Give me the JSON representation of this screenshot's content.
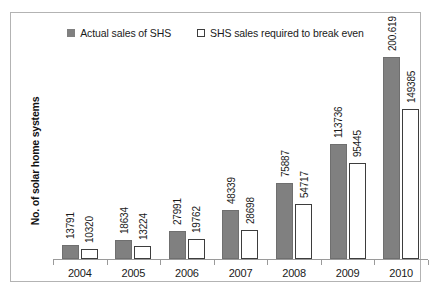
{
  "chart_data": {
    "type": "bar",
    "title": "",
    "subtitle": "",
    "xlabel": "",
    "ylabel": "No. of solar home systems",
    "categories": [
      "2004",
      "2005",
      "2006",
      "2007",
      "2008",
      "2009",
      "2010"
    ],
    "series": [
      {
        "name": "Actual sales of SHS",
        "swatch": "filled-gray-square",
        "color": "#808080",
        "values": [
          13791,
          18634,
          27991,
          48339,
          75887,
          113736,
          200619
        ],
        "labels": [
          "13791",
          "18634",
          "27991",
          "48339",
          "75887",
          "113736",
          "200.619"
        ]
      },
      {
        "name": "SHS sales required to break even",
        "swatch": "hollow-white-square",
        "color": "#ffffff",
        "border_color": "#3d3d3d",
        "values": [
          10320,
          13224,
          19762,
          28698,
          54717,
          95445,
          149385
        ],
        "labels": [
          "10320",
          "13224",
          "19762",
          "28698",
          "54717",
          "95445",
          "149385"
        ]
      }
    ],
    "ylim": [
      0,
      200619
    ],
    "y_tick_labels": [],
    "grid": false,
    "legend_position": "top-center",
    "data_labels_rotation": "vertical",
    "plot_border_color": "#b3b3b3",
    "axis_line_color": "#9a9a9a"
  },
  "legend": {
    "entries": [
      {
        "label": "Actual sales of SHS"
      },
      {
        "label": "SHS sales required to break even"
      }
    ]
  }
}
